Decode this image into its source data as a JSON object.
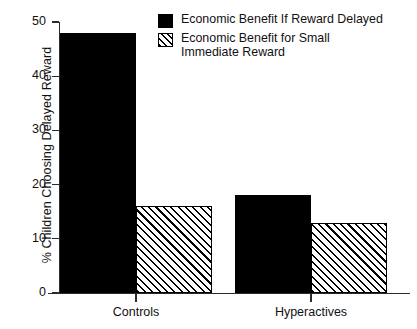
{
  "chart_data": {
    "type": "bar",
    "title": "",
    "xlabel": "",
    "ylabel": "% Children Choosing Delayed Reward",
    "ylim": [
      0,
      50
    ],
    "yticks": [
      0,
      10,
      20,
      30,
      40,
      50
    ],
    "ytick_labels": [
      "0",
      "10",
      "20",
      "30",
      "40",
      "50"
    ],
    "grid": false,
    "legend_position": "top-right",
    "categories": [
      "Controls",
      "Hyperactives"
    ],
    "series": [
      {
        "name": "Economic Benefit If Reward Delayed",
        "fill": "solid-black",
        "color": "#000000",
        "values": [
          48,
          18
        ]
      },
      {
        "name": "Economic Benefit for Small Immediate Reward",
        "fill": "diagonal-hatch",
        "color": "#000000",
        "values": [
          16,
          13
        ]
      }
    ]
  },
  "legend": {
    "items": [
      {
        "label": "Economic Benefit If Reward Delayed",
        "swatch": "solid"
      },
      {
        "label_line1": "Economic Benefit for Small",
        "label_line2": "Immediate Reward",
        "swatch": "hatch"
      }
    ]
  },
  "axes": {
    "y_title": "% Children Choosing Delayed Reward",
    "y_labels": [
      "50",
      "40",
      "30",
      "20",
      "10",
      "0"
    ],
    "x_labels": [
      "Controls",
      "Hyperactives"
    ]
  }
}
